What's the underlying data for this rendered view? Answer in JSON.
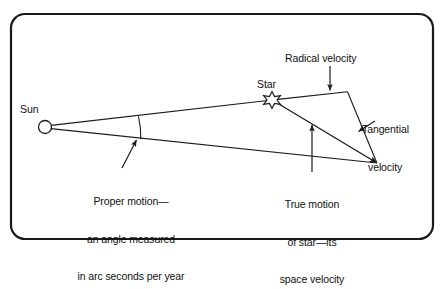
{
  "figure": {
    "kind": "astronomy-diagram",
    "title_visible": "",
    "border": {
      "style": "rounded-rectangle",
      "color": "#1a1a1a",
      "radius_px": 14,
      "thickness_px": 2.2,
      "x": 11,
      "y": 14,
      "width": 422,
      "height": 225
    },
    "background_color": "#ffffff",
    "line_color": "#1a1a1a"
  },
  "labels": {
    "sun": "Sun",
    "star": "Star",
    "radial_velocity": "Radical velocity",
    "tangential_velocity_line1": "Tangential",
    "tangential_velocity_line2": "velocity",
    "proper_motion_line1": "Proper motion—",
    "proper_motion_line2": "an angle measured",
    "proper_motion_line3": "in arc seconds per year",
    "true_motion_line1": "True motion",
    "true_motion_line2": "of star—its",
    "true_motion_line3": "space velocity"
  },
  "geometry": {
    "sun_marker": {
      "cx": 45,
      "cy": 127,
      "r": 6.5,
      "shape": "circle-open"
    },
    "star_marker": {
      "cx": 272,
      "cy": 100,
      "r": 8,
      "shape": "six-point-star-open"
    },
    "vertex_radial_corner": {
      "x": 347,
      "y": 92
    },
    "vertex_space_velocity_tip": {
      "x": 377,
      "y": 163
    },
    "sight_line_upper": {
      "x1": 45,
      "y1": 126,
      "x2": 272,
      "y2": 100
    },
    "sight_line_lower": {
      "x1": 45,
      "y1": 129,
      "x2": 377,
      "y2": 163
    },
    "radial_velocity_segment": {
      "x1": 272,
      "y1": 99,
      "x2": 347,
      "y2": 92
    },
    "tangential_velocity_segment": {
      "x1": 347,
      "y1": 92,
      "x2": 377,
      "y2": 163
    },
    "space_velocity_segment": {
      "x1": 273,
      "y1": 103,
      "x2": 377,
      "y2": 163
    },
    "proper_motion_arc": {
      "cx": 45,
      "cy": 127,
      "radius": 95,
      "from_deg": -7,
      "to_deg": 6
    },
    "leader_radial": {
      "x1": 330,
      "y1": 68,
      "x2": 330,
      "y2": 91
    },
    "leader_tangential": {
      "x1": 377,
      "y1": 122,
      "x2": 360,
      "y2": 133
    },
    "leader_proper_motion": {
      "x1": 123,
      "y1": 168,
      "x2": 137,
      "y2": 140
    },
    "leader_true_motion": {
      "x1": 312,
      "y1": 172,
      "x2": 312,
      "y2": 126
    }
  },
  "label_positions": {
    "sun": {
      "left": 20,
      "top": 103
    },
    "star": {
      "left": 258,
      "top": 78
    },
    "radial_velocity": {
      "left": 285,
      "top": 52
    },
    "tangential_velocity": {
      "left": 362,
      "top": 99
    },
    "proper_motion": {
      "left": 57,
      "top": 170
    },
    "true_motion": {
      "left": 267,
      "top": 173
    }
  }
}
